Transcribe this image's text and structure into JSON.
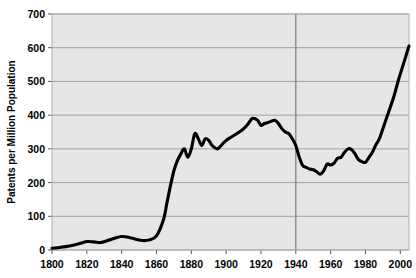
{
  "chart_data": {
    "type": "line",
    "title": "",
    "xlabel": "",
    "ylabel": "Patents per Million Population",
    "xlim": [
      1800,
      2005
    ],
    "ylim": [
      0,
      700
    ],
    "xticks": [
      1800,
      1820,
      1840,
      1860,
      1880,
      1900,
      1920,
      1940,
      1960,
      1980,
      2000
    ],
    "yticks": [
      0,
      100,
      200,
      300,
      400,
      500,
      600,
      700
    ],
    "grid": "horizontal-plus-1940-vertical",
    "legend": "none",
    "series": [
      {
        "name": "Patents per Million Population",
        "x": [
          1800,
          1805,
          1810,
          1815,
          1820,
          1824,
          1828,
          1832,
          1836,
          1840,
          1844,
          1848,
          1852,
          1856,
          1860,
          1864,
          1866,
          1868,
          1870,
          1872,
          1874,
          1876,
          1878,
          1880,
          1882,
          1884,
          1886,
          1888,
          1890,
          1892,
          1895,
          1898,
          1900,
          1903,
          1906,
          1909,
          1912,
          1915,
          1918,
          1920,
          1922,
          1925,
          1928,
          1930,
          1932,
          1934,
          1936,
          1938,
          1940,
          1942,
          1944,
          1946,
          1948,
          1950,
          1952,
          1954,
          1956,
          1958,
          1960,
          1962,
          1964,
          1966,
          1968,
          1970,
          1972,
          1974,
          1976,
          1978,
          1980,
          1982,
          1984,
          1986,
          1988,
          1990,
          1993,
          1996,
          1999,
          2002,
          2005
        ],
        "values": [
          5,
          8,
          12,
          18,
          25,
          24,
          22,
          28,
          35,
          40,
          38,
          32,
          28,
          30,
          42,
          90,
          140,
          190,
          235,
          265,
          285,
          300,
          275,
          300,
          345,
          330,
          310,
          330,
          325,
          310,
          300,
          315,
          325,
          335,
          345,
          355,
          370,
          390,
          385,
          370,
          375,
          380,
          385,
          375,
          360,
          350,
          345,
          330,
          310,
          275,
          250,
          245,
          240,
          238,
          232,
          225,
          235,
          255,
          252,
          258,
          272,
          275,
          290,
          300,
          298,
          285,
          268,
          262,
          260,
          275,
          290,
          312,
          330,
          360,
          405,
          450,
          505,
          555,
          605
        ]
      }
    ]
  },
  "axis": {
    "y_title": "Patents per Million Population",
    "y_tick_labels": [
      "700",
      "600",
      "500",
      "400",
      "300",
      "200",
      "100",
      "0"
    ],
    "x_tick_labels": [
      "1800",
      "1820",
      "1840",
      "1860",
      "1880",
      "1900",
      "1920",
      "1940",
      "1960",
      "1980",
      "2000"
    ]
  },
  "colors": {
    "line": "#000000",
    "plot_background": "#e6e6e6",
    "grid": "#9a9a9a",
    "page_background": "#ffffff"
  }
}
